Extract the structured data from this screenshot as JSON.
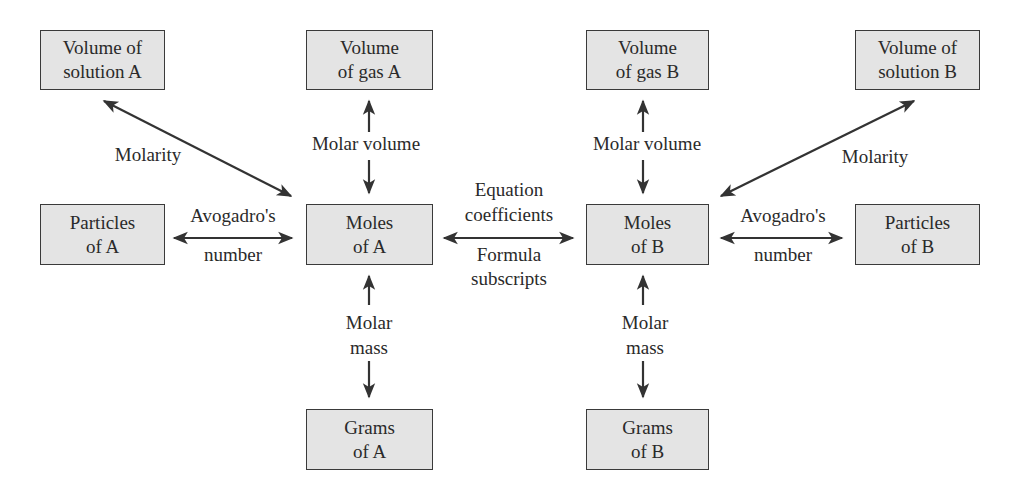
{
  "diagram": {
    "colors": {
      "box_fill": "#e4e4e4",
      "box_border": "#3a3a3a",
      "arrow": "#333333",
      "text": "#2a2a2a"
    },
    "nodes": {
      "volume_solution_a": {
        "line1": "Volume of",
        "line2": "solution A"
      },
      "volume_gas_a": {
        "line1": "Volume",
        "line2": "of gas A"
      },
      "particles_a": {
        "line1": "Particles",
        "line2": "of A"
      },
      "moles_a": {
        "line1": "Moles",
        "line2": "of A"
      },
      "grams_a": {
        "line1": "Grams",
        "line2": "of A"
      },
      "volume_gas_b": {
        "line1": "Volume",
        "line2": "of gas B"
      },
      "volume_solution_b": {
        "line1": "Volume of",
        "line2": "solution B"
      },
      "moles_b": {
        "line1": "Moles",
        "line2": "of B"
      },
      "particles_b": {
        "line1": "Particles",
        "line2": "of B"
      },
      "grams_b": {
        "line1": "Grams",
        "line2": "of B"
      }
    },
    "edge_labels": {
      "molarity_a": "Molarity",
      "molar_volume_a": "Molar volume",
      "avogadro_a_line1": "Avogadro's",
      "avogadro_a_line2": "number",
      "molar_mass_a_line1": "Molar",
      "molar_mass_a_line2": "mass",
      "equation_line1": "Equation",
      "equation_line2": "coefficients",
      "formula_line1": "Formula",
      "formula_line2": "subscripts",
      "molar_volume_b": "Molar volume",
      "molarity_b": "Molarity",
      "avogadro_b_line1": "Avogadro's",
      "avogadro_b_line2": "number",
      "molar_mass_b_line1": "Molar",
      "molar_mass_b_line2": "mass"
    },
    "edges": [
      {
        "from": "moles_a",
        "to": "volume_solution_a",
        "label": "Molarity",
        "bidirectional": true
      },
      {
        "from": "moles_a",
        "to": "volume_gas_a",
        "label": "Molar volume",
        "bidirectional": true
      },
      {
        "from": "moles_a",
        "to": "particles_a",
        "label": "Avogadro's number",
        "bidirectional": true
      },
      {
        "from": "moles_a",
        "to": "grams_a",
        "label": "Molar mass",
        "bidirectional": true
      },
      {
        "from": "moles_a",
        "to": "moles_b",
        "label": "Equation coefficients / Formula subscripts",
        "bidirectional": true
      },
      {
        "from": "moles_b",
        "to": "volume_gas_b",
        "label": "Molar volume",
        "bidirectional": true
      },
      {
        "from": "moles_b",
        "to": "volume_solution_b",
        "label": "Molarity",
        "bidirectional": true
      },
      {
        "from": "moles_b",
        "to": "particles_b",
        "label": "Avogadro's number",
        "bidirectional": true
      },
      {
        "from": "moles_b",
        "to": "grams_b",
        "label": "Molar mass",
        "bidirectional": true
      }
    ]
  }
}
